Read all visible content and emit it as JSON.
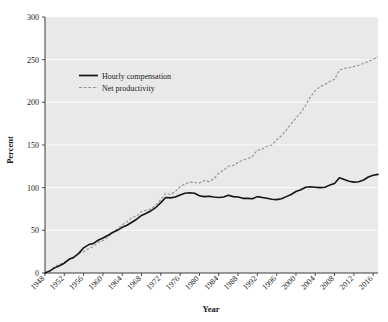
{
  "chart_data": {
    "type": "line",
    "title": "",
    "xlabel": "Year",
    "ylabel": "Percent",
    "xlim": [
      1948,
      2017
    ],
    "ylim": [
      0,
      300
    ],
    "yticks": [
      0,
      50,
      100,
      150,
      200,
      250,
      300
    ],
    "xticks": [
      1948,
      1952,
      1956,
      1960,
      1964,
      1968,
      1972,
      1976,
      1980,
      1984,
      1988,
      1992,
      1996,
      2000,
      2004,
      2008,
      2012,
      2016
    ],
    "grid": true,
    "legend_position": "upper-left-inside",
    "x": [
      1948,
      1949,
      1950,
      1951,
      1952,
      1953,
      1954,
      1955,
      1956,
      1957,
      1958,
      1959,
      1960,
      1961,
      1962,
      1963,
      1964,
      1965,
      1966,
      1967,
      1968,
      1969,
      1970,
      1971,
      1972,
      1973,
      1974,
      1975,
      1976,
      1977,
      1978,
      1979,
      1980,
      1981,
      1982,
      1983,
      1984,
      1985,
      1986,
      1987,
      1988,
      1989,
      1990,
      1991,
      1992,
      1993,
      1994,
      1995,
      1996,
      1997,
      1998,
      1999,
      2000,
      2001,
      2002,
      2003,
      2004,
      2005,
      2006,
      2007,
      2008,
      2009,
      2010,
      2011,
      2012,
      2013,
      2014,
      2015,
      2016,
      2017
    ],
    "series": [
      {
        "name": "Hourly compensation",
        "style": "solid",
        "color": "#141414",
        "final_value": 115.6,
        "values": [
          0,
          2.5,
          6.0,
          8.5,
          11.5,
          16.0,
          18.5,
          23.0,
          29.5,
          33.0,
          34.5,
          38.5,
          41.0,
          44.0,
          47.5,
          50.0,
          53.5,
          56.0,
          59.5,
          63.0,
          67.5,
          70.0,
          73.0,
          77.0,
          82.5,
          88.5,
          88.0,
          89.0,
          91.5,
          93.5,
          94.0,
          93.5,
          90.5,
          89.5,
          90.0,
          89.0,
          88.5,
          89.0,
          91.0,
          89.5,
          89.0,
          87.5,
          87.5,
          87.0,
          89.5,
          88.5,
          87.5,
          86.5,
          86.0,
          87.0,
          89.5,
          92.0,
          95.5,
          97.5,
          100.5,
          101.0,
          100.5,
          100.0,
          100.5,
          103.0,
          105.0,
          111.5,
          109.5,
          107.5,
          106.5,
          107.0,
          109.0,
          112.5,
          114.5,
          115.6
        ]
      },
      {
        "name": "Net productivity",
        "style": "dashed",
        "color": "#8f8f8f",
        "final_value": 253.0,
        "values": [
          0,
          2.0,
          7.5,
          10.0,
          12.5,
          16.5,
          18.0,
          23.0,
          25.0,
          28.5,
          31.0,
          36.0,
          38.0,
          42.0,
          47.0,
          51.5,
          56.5,
          60.0,
          65.0,
          67.0,
          72.0,
          73.5,
          75.0,
          80.0,
          86.0,
          93.5,
          92.0,
          95.5,
          101.0,
          104.5,
          106.5,
          106.0,
          105.5,
          108.5,
          107.0,
          110.5,
          117.0,
          120.5,
          125.0,
          126.0,
          129.5,
          132.5,
          134.0,
          136.5,
          144.0,
          145.0,
          148.5,
          150.0,
          156.0,
          161.0,
          167.5,
          175.0,
          181.5,
          188.0,
          196.5,
          206.5,
          213.5,
          218.5,
          221.0,
          224.5,
          227.0,
          237.5,
          240.0,
          240.5,
          242.0,
          243.5,
          245.5,
          248.0,
          250.5,
          253.0
        ]
      }
    ]
  },
  "legend": {
    "items": [
      {
        "label": "Hourly compensation",
        "style": "solid"
      },
      {
        "label": "Net productivity",
        "style": "dashed"
      }
    ]
  },
  "colors": {
    "plot_background": "#e9e9e9",
    "gridline": "#fbfbfb",
    "axis": "#3a3a3a",
    "compensation": "#141414",
    "productivity": "#8f8f8f"
  }
}
